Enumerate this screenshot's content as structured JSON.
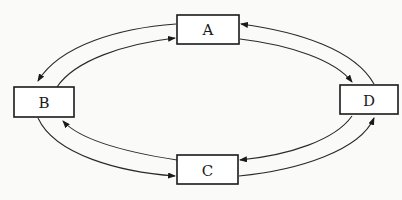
{
  "diagram": {
    "type": "cycle-graph",
    "background": "#fafaf8",
    "stroke_color": "#1a1a1a",
    "nodes": [
      {
        "id": "A",
        "label": "A",
        "x": 177,
        "y": 15,
        "w": 62,
        "h": 29
      },
      {
        "id": "B",
        "label": "B",
        "x": 14,
        "y": 87,
        "w": 60,
        "h": 30
      },
      {
        "id": "C",
        "label": "C",
        "x": 177,
        "y": 155,
        "w": 61,
        "h": 29
      },
      {
        "id": "D",
        "label": "D",
        "x": 340,
        "y": 85,
        "w": 58,
        "h": 29
      }
    ],
    "edges": [
      {
        "from": "A",
        "to": "B",
        "path": "outer"
      },
      {
        "from": "B",
        "to": "A",
        "path": "inner"
      },
      {
        "from": "D",
        "to": "A",
        "path": "outer"
      },
      {
        "from": "A",
        "to": "D",
        "path": "inner"
      },
      {
        "from": "C",
        "to": "B",
        "path": "inner"
      },
      {
        "from": "B",
        "to": "C",
        "path": "outer"
      },
      {
        "from": "D",
        "to": "C",
        "path": "inner"
      },
      {
        "from": "C",
        "to": "D",
        "path": "outer"
      }
    ]
  }
}
